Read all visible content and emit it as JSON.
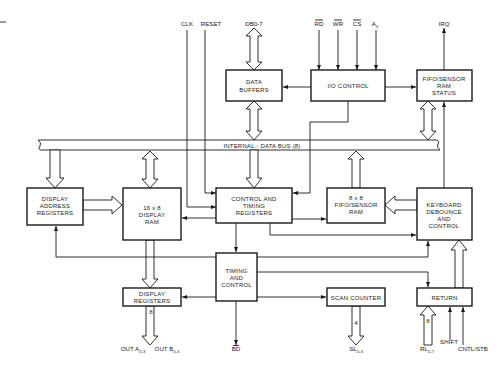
{
  "diagram": {
    "bus_label": "INTERNAL - DATA BUS (8)",
    "blocks": {
      "data_buffers": [
        "DATA",
        "BUFFERS"
      ],
      "io_control": [
        "I/O CONTROL"
      ],
      "fifo_status": [
        "FIFO/SENSOR",
        "RAM",
        "STATUS"
      ],
      "display_address_registers": [
        "DISPLAY",
        "ADDRESS",
        "REGISTERS"
      ],
      "display_ram": [
        "16 x 8",
        "DISPLAY",
        "RAM"
      ],
      "control_timing_registers": [
        "CONTROL AND",
        "TIMING",
        "REGISTERS"
      ],
      "fifo_ram": [
        "8 x 8",
        "FIFO/SENSOR",
        "RAM"
      ],
      "keyboard_debounce": [
        "KEYBOARD",
        "DEBOUNCE",
        "AND",
        "CONTROL"
      ],
      "timing_control": [
        "TIMING",
        "AND",
        "CONTROL"
      ],
      "display_registers": [
        "DISPLAY",
        "REGISTERS"
      ],
      "scan_counter": [
        "SCAN COUNTER"
      ],
      "return": [
        "RETURN"
      ]
    },
    "signals": {
      "clk": "CLK",
      "reset": "RESET",
      "db": "DB0-7",
      "rd": "RD",
      "wr": "WR",
      "cs": "CS",
      "a0": "A",
      "a0_sub": "0",
      "irq": "IRQ",
      "bd": "BD",
      "out_a": "OUT A",
      "out_a_sub": "0-3",
      "out_b": "OUT B",
      "out_b_sub": "0-3",
      "sl": "SL",
      "sl_sub": "0-3",
      "rl": "RL",
      "rl_sub": "0-7",
      "shift": "SHIFT",
      "cntl_stb": "CNTL/STB"
    },
    "bus_widths": {
      "display_out": "8",
      "scan_out": "4",
      "return_in": "8"
    }
  }
}
